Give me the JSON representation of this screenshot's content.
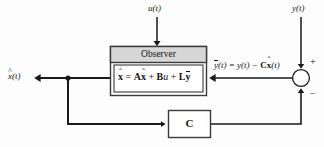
{
  "diagram": {
    "colors": {
      "line": "#1a1a1a",
      "box_fill": "#ffffff",
      "header_fill": "#d6d6d6",
      "box_stroke": "#3a3a3a",
      "background": "#fdfdfd"
    },
    "signals": {
      "input_u": "u(t)",
      "measured_y": "y(t)",
      "state_estimate_out": "x(t)",
      "state_estimate_hat": "^",
      "error_expression_lhs": "y(t)",
      "error_expression_rhs": "= y(t) − Cx(t)"
    },
    "observer_block": {
      "header_label": "Observer",
      "equation": {
        "lhs_symbol": "x",
        "lhs_marks": "̇̂",
        "equals": "=",
        "term_a_matrix": "A",
        "term_a_state": "x",
        "plus_1": "+",
        "term_b_matrix": "B",
        "term_b_input": "u",
        "plus_2": "+",
        "term_l_matrix": "L",
        "term_l_signal": "y",
        "full_text": "ẋ̂ = Ax̂ + Bu + Lȳ"
      }
    },
    "feedback_block": {
      "label": "C"
    },
    "summing_junction": {
      "plus_sign": "+",
      "minus_sign": "−",
      "plus_input": "y(t)",
      "minus_input": "Cx(t)"
    }
  }
}
